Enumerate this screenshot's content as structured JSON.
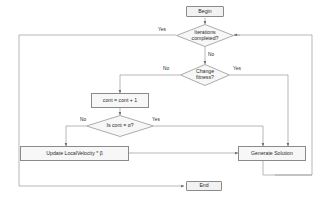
{
  "diagram": {
    "type": "flowchart",
    "title": "",
    "nodes": {
      "begin": {
        "label": "Begin",
        "shape": "terminal"
      },
      "iterations_completed": {
        "label": "Iterations completed?",
        "line1": "Iterations",
        "line2": "completed?",
        "shape": "decision"
      },
      "change_fitness": {
        "label": "Change fitness?",
        "line1": "Change",
        "line2": "fitness?",
        "shape": "decision"
      },
      "cont_increment": {
        "label": "cont = cont + 1",
        "shape": "process"
      },
      "is_cont_alpha": {
        "label": "Is cont = α?",
        "shape": "decision"
      },
      "update_local_velocity": {
        "label": "Update LocalVelocity * β",
        "shape": "process"
      },
      "generate_solution": {
        "label": "Generate Solution",
        "shape": "process"
      },
      "end": {
        "label": "End",
        "shape": "terminal"
      }
    },
    "edge_labels": {
      "iterations_yes": "Yes",
      "iterations_no": "No",
      "fitness_no": "No",
      "fitness_yes": "Yes",
      "cont_no": "No",
      "cont_yes": "Yes"
    },
    "colors": {
      "stroke": "#8a8a8a",
      "terminal_fill": "#f2f2f2",
      "process_fill": "#f7f7f7",
      "decision_fill": "#f7f7f7",
      "text": "#2b2b2b",
      "background": "#ffffff"
    }
  }
}
